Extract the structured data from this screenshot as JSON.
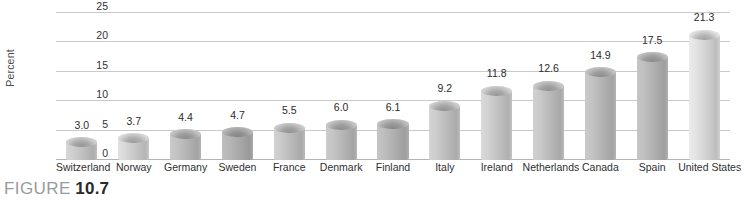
{
  "caption": {
    "word": "FIGURE",
    "number": "10.7"
  },
  "chart_data": {
    "type": "bar",
    "title": "",
    "subtitle": "",
    "xlabel": "",
    "ylabel": "Percent",
    "ylim": [
      0,
      25
    ],
    "yticks": [
      0,
      5,
      10,
      15,
      20,
      25
    ],
    "ytick_labels": [
      "0",
      "5",
      "10",
      "15",
      "20",
      "25"
    ],
    "grid": true,
    "legend": false,
    "legend_position": "none",
    "categories": [
      "Switzerland",
      "Norway",
      "Germany",
      "Sweden",
      "France",
      "Denmark",
      "Finland",
      "Italy",
      "Ireland",
      "Netherlands",
      "Canada",
      "Spain",
      "United States"
    ],
    "values": [
      3.0,
      3.7,
      4.4,
      4.7,
      5.5,
      6.0,
      6.1,
      9.2,
      11.8,
      12.6,
      14.9,
      17.5,
      21.3
    ],
    "value_labels": [
      "3.0",
      "3.7",
      "4.4",
      "4.7",
      "5.5",
      "6.0",
      "6.1",
      "9.2",
      "11.8",
      "12.6",
      "14.9",
      "17.5",
      "21.3"
    ],
    "bar_colors": [
      "#c9c9c9",
      "#d2d2d2",
      "#bdbdbd",
      "#b2b2b2",
      "#c4c4c4",
      "#bfbfbf",
      "#b8b8b8",
      "#c6c6c6",
      "#cccccc",
      "#c3c3c3",
      "#bdbdbd",
      "#b9b9b9",
      "#dcdcdc"
    ],
    "colors": {
      "gridline": "#c9c9c9",
      "baseline": "#b4b4b4",
      "value_text": "#2b2b2b",
      "axis_text": "#333333",
      "caption_word": "#9a9a9a",
      "caption_number": "#2a2a2a",
      "background": "#ffffff"
    }
  }
}
